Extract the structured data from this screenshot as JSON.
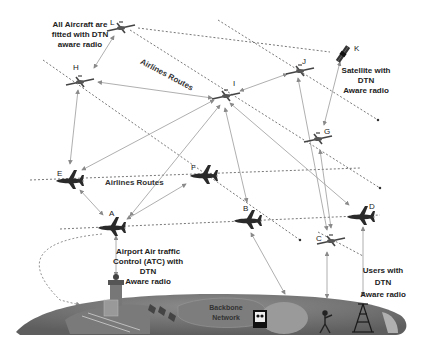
{
  "diagram": {
    "annotations": {
      "aircraft_note": [
        "All Aircraft are",
        "fitted  with DTN",
        "aware radio"
      ],
      "satellite_note": [
        "Satellite with",
        "DTN",
        "Aware radio"
      ],
      "atc_note": [
        "Airport Air traffic",
        "Control (ATC) with",
        "DTN",
        "Aware radio"
      ],
      "users_note": [
        "Users with",
        "DTN",
        "Aware radio"
      ],
      "backbone_label": [
        "Backbone",
        "Network"
      ],
      "route_label_top": "Airlines Routes",
      "route_label_mid": "Airlines Routes"
    },
    "nodes": [
      {
        "id": "L",
        "type": "aircraft-small",
        "x": 117,
        "y": 27
      },
      {
        "id": "H",
        "type": "aircraft-small",
        "x": 80,
        "y": 80
      },
      {
        "id": "I",
        "type": "aircraft-small",
        "x": 226,
        "y": 93
      },
      {
        "id": "J",
        "type": "aircraft-small",
        "x": 299,
        "y": 70
      },
      {
        "id": "K",
        "type": "satellite",
        "x": 345,
        "y": 52
      },
      {
        "id": "G",
        "type": "aircraft-small",
        "x": 316,
        "y": 138
      },
      {
        "id": "E",
        "type": "aircraft-large",
        "x": 68,
        "y": 180
      },
      {
        "id": "F",
        "type": "aircraft-large",
        "x": 203,
        "y": 175
      },
      {
        "id": "A",
        "type": "aircraft-large",
        "x": 112,
        "y": 226
      },
      {
        "id": "B",
        "type": "aircraft-large",
        "x": 248,
        "y": 220
      },
      {
        "id": "D",
        "type": "aircraft-large",
        "x": 360,
        "y": 216
      },
      {
        "id": "C",
        "type": "aircraft-small",
        "x": 331,
        "y": 239
      }
    ],
    "links": [
      [
        "L",
        "H"
      ],
      [
        "H",
        "I"
      ],
      [
        "I",
        "J"
      ],
      [
        "H",
        "E"
      ],
      [
        "I",
        "E"
      ],
      [
        "I",
        "A"
      ],
      [
        "I",
        "B"
      ],
      [
        "I",
        "D"
      ],
      [
        "J",
        "B"
      ],
      [
        "G",
        "C"
      ],
      [
        "E",
        "A"
      ],
      [
        "F",
        "A"
      ],
      [
        "A",
        "ATC"
      ],
      [
        "B",
        "Backbone"
      ],
      [
        "C",
        "Tower"
      ],
      [
        "D",
        "Users"
      ],
      [
        "G",
        "K"
      ]
    ],
    "colors": {
      "ground_dark": "#6e6e6e",
      "ground_mid": "#8a8a8a",
      "ground_light": "#a8a8a8",
      "link": "#9a9a9a",
      "route": "#555555",
      "aircraft": "#2a2a2a"
    }
  }
}
